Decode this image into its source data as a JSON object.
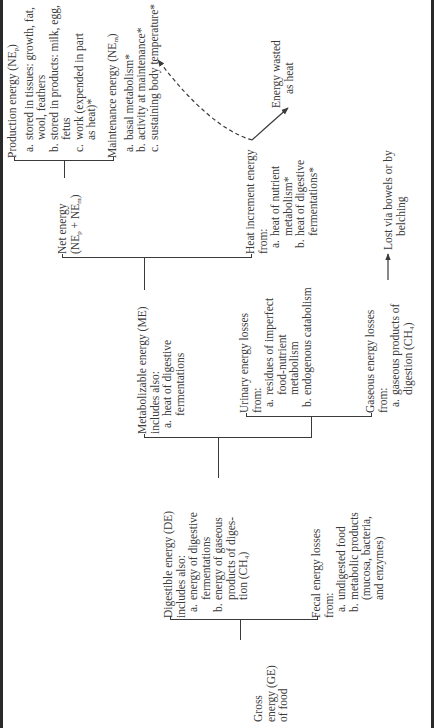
{
  "diagram": {
    "nodes": {
      "gross": {
        "lines": [
          "Gross",
          "energy (GE)",
          "of food"
        ]
      },
      "digestible": {
        "title": "Digestible energy (DE)",
        "subtitle": "includes also:",
        "items": [
          {
            "key": "a.",
            "text": "energy of digestive\nfermentations"
          },
          {
            "key": "b.",
            "text": "energy of gaseous\nproducts of diges-\ntion (CH₄)"
          }
        ]
      },
      "fecal": {
        "title": "Fecal energy losses",
        "subtitle": "from:",
        "items": [
          {
            "key": "a.",
            "text": "undigested food"
          },
          {
            "key": "b.",
            "text": "metabolic products\n(mucosa, bacteria,\nand enzymes)"
          }
        ]
      },
      "metabolizable": {
        "title": "Metabolizable energy (ME)",
        "subtitle": "includes also:",
        "items": [
          {
            "key": "a.",
            "text": "heat of digestive\nfermentations"
          }
        ]
      },
      "urinary": {
        "title": "Urinary energy losses",
        "subtitle": "from:",
        "items": [
          {
            "key": "a.",
            "text": "residues of imperfect\nfood-nutrient\nmetabolism"
          },
          {
            "key": "b.",
            "text": "endogenous catabolism"
          }
        ]
      },
      "gaseous": {
        "title": "Gaseous energy losses",
        "subtitle": "from:",
        "items": [
          {
            "key": "a.",
            "text": "gaseous products of\ndigestion (CH₄)"
          }
        ]
      },
      "lost": {
        "lines": [
          "Lost via bowels or by",
          "belching"
        ]
      },
      "net": {
        "lines": [
          "Net energy",
          "(NEp + NEm)"
        ]
      },
      "heat_increment": {
        "title": "Heat increment energy",
        "subtitle": "from:",
        "items": [
          {
            "key": "a.",
            "text": "heat of nutrient\nmetabolism*"
          },
          {
            "key": "b.",
            "text": "heat of digestive\nfermentations*"
          }
        ]
      },
      "wasted": {
        "lines": [
          "Energy wasted",
          "as heat"
        ]
      },
      "production": {
        "title": "Production energy (NEp)",
        "items": [
          {
            "key": "a.",
            "text": "stored in tissues: growth, fat,\nwool, feathers"
          },
          {
            "key": "b.",
            "text": "stored in products: milk, egg,\nfetus"
          },
          {
            "key": "c.",
            "text": "work (expended in part\nas heat)*"
          }
        ]
      },
      "maintenance": {
        "title": "Maintenance energy (NEm)",
        "items": [
          {
            "key": "a.",
            "text": "basal metabolism*"
          },
          {
            "key": "b.",
            "text": "activity at maintenance*"
          },
          {
            "key": "c.",
            "text": "sustaining body temperature*"
          }
        ]
      }
    },
    "edges": [
      {
        "from": "gross",
        "to": "digestible",
        "style": "bracket"
      },
      {
        "from": "gross",
        "to": "fecal",
        "style": "bracket"
      },
      {
        "from": "digestible",
        "to": "metabolizable",
        "style": "bracket"
      },
      {
        "from": "digestible",
        "to": "urinary",
        "style": "bracket"
      },
      {
        "from": "digestible",
        "to": "gaseous",
        "style": "bracket"
      },
      {
        "from": "gaseous",
        "to": "lost",
        "style": "arrow"
      },
      {
        "from": "metabolizable",
        "to": "net",
        "style": "bracket"
      },
      {
        "from": "metabolizable",
        "to": "heat_increment",
        "style": "bracket"
      },
      {
        "from": "net",
        "to": "production",
        "style": "bracket"
      },
      {
        "from": "net",
        "to": "maintenance",
        "style": "bracket"
      },
      {
        "from": "heat_increment",
        "to": "wasted",
        "style": "arrow-solid"
      },
      {
        "from": "heat_increment",
        "to": "maintenance",
        "style": "arrow-dashed"
      }
    ],
    "colors": {
      "ink": "#3a3a3a",
      "border": "#2a2a2a",
      "background": "#ffffff"
    }
  }
}
